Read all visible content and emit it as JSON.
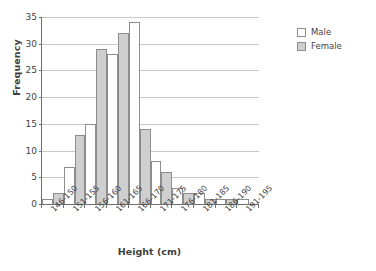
{
  "chart_data": {
    "type": "bar",
    "title": "",
    "xlabel": "Height (cm)",
    "ylabel": "Frequency",
    "categories": [
      "146-150",
      "151-155",
      "156-160",
      "161-165",
      "166-170",
      "171-175",
      "176-180",
      "181-185",
      "186-190",
      "191-195"
    ],
    "series": [
      {
        "name": "Male",
        "color": "#ffffff",
        "values": [
          1,
          7,
          15,
          28,
          34,
          8,
          3,
          2,
          1,
          1
        ]
      },
      {
        "name": "Female",
        "color": "#cfcfcf",
        "values": [
          2,
          13,
          29,
          32,
          14,
          6,
          2,
          1,
          1,
          0
        ]
      }
    ],
    "ylim": [
      0,
      35
    ],
    "ytick_step": 5,
    "yticks": [
      0,
      5,
      10,
      15,
      20,
      25,
      30,
      35
    ],
    "ytick_labels": [
      "0",
      "5",
      "10",
      "15",
      "20",
      "25",
      "30",
      "35"
    ],
    "grid": true,
    "grid_axis": "y",
    "legend": true,
    "legend_position": "right",
    "legend_entries": [
      "Male",
      "Female"
    ],
    "bar_style": "adjacent-histogram"
  },
  "axes": {
    "y_title": "Frequency",
    "x_title": "Height (cm)"
  },
  "legend": {
    "entries": [
      {
        "label": "Male",
        "swatch": "male-swatch"
      },
      {
        "label": "Female",
        "swatch": "female-swatch"
      }
    ]
  },
  "colors": {
    "male_fill": "#ffffff",
    "female_fill": "#cfcfcf",
    "bar_stroke": "#8d8d8d",
    "axis": "#6f6f6f",
    "gridline": "#c9c9c9",
    "text": "#3f3f3f"
  }
}
